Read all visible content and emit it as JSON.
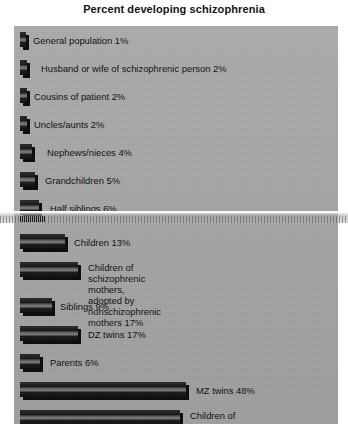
{
  "chart_data": {
    "type": "bar",
    "title": "Percent developing schizophrenia",
    "xlabel": "",
    "ylabel": "",
    "orientation": "horizontal",
    "grid": false,
    "legend": null,
    "xlim": [
      0,
      50
    ],
    "value_unit": "%",
    "categories": [
      "General population",
      "Husband or wife of schizophrenic person",
      "Cousins of patient",
      "Uncles/aunts",
      "Nephews/nieces",
      "Grandchildren",
      "Half siblings",
      "Children",
      "Children of schizophrenic mothers, adopted by nonschizophrenic mothers",
      "Siblings",
      "DZ twins",
      "Parents",
      "MZ twins",
      "Children of two schizophrenic parents"
    ],
    "values": [
      1,
      2,
      2,
      2,
      4,
      5,
      6,
      13,
      17,
      9,
      17,
      6,
      48,
      46
    ],
    "bars": [
      {
        "label": "General population 1%",
        "label_lines": [
          "General population 1%"
        ],
        "category": "General population",
        "value": 1,
        "top": 6,
        "bar_width": 6,
        "label_left": 13
      },
      {
        "label": "Husband or wife of schizophrenic person 2%",
        "label_lines": [
          "Husband or wife of schizophrenic person 2%"
        ],
        "category": "Husband or wife of schizophrenic person",
        "value": 2,
        "top": 34,
        "bar_width": 7,
        "label_left": 21
      },
      {
        "label": "Cousins of patient 2%",
        "label_lines": [
          "Cousins of patient 2%"
        ],
        "category": "Cousins of patient",
        "value": 2,
        "top": 62,
        "bar_width": 7,
        "label_left": 14
      },
      {
        "label": "Uncles/aunts 2%",
        "label_lines": [
          "Uncles/aunts 2%"
        ],
        "category": "Uncles/aunts",
        "value": 2,
        "top": 90,
        "bar_width": 7,
        "label_left": 14
      },
      {
        "label": "Nephews/nieces 4%",
        "label_lines": [
          "Nephews/nieces 4%"
        ],
        "category": "Nephews/nieces",
        "value": 4,
        "top": 118,
        "bar_width": 12,
        "label_left": 27
      },
      {
        "label": "Grandchildren 5%",
        "label_lines": [
          "Grandchildren 5%"
        ],
        "category": "Grandchildren",
        "value": 5,
        "top": 146,
        "bar_width": 15,
        "label_left": 25
      },
      {
        "label": "Half siblings 6%",
        "label_lines": [
          "Half siblings 6%"
        ],
        "category": "Half siblings",
        "value": 6,
        "top": 174,
        "bar_width": 19,
        "label_left": 30
      },
      {
        "label": "Children 13%",
        "label_lines": [
          "Children 13%"
        ],
        "category": "Children",
        "value": 13,
        "top": 208,
        "bar_width": 45,
        "label_left": 54
      },
      {
        "label": "Children of schizophrenic mothers,\nadopted by nonschizophrenic mothers 17%",
        "label_lines": [
          "Children of schizophrenic mothers,",
          "adopted by nonschizophrenic mothers 17%"
        ],
        "category": "Children of schizophrenic mothers, adopted by nonschizophrenic mothers",
        "value": 17,
        "top": 236,
        "bar_width": 58,
        "label_left": 68,
        "two_line": true
      },
      {
        "label": "Siblings 9%",
        "label_lines": [
          "Siblings 9%"
        ],
        "category": "Siblings",
        "value": 9,
        "top": 272,
        "bar_width": 32,
        "label_left": 40
      },
      {
        "label": "DZ twins 17%",
        "label_lines": [
          "DZ twins 17%"
        ],
        "category": "DZ twins",
        "value": 17,
        "top": 300,
        "bar_width": 58,
        "label_left": 68
      },
      {
        "label": "Parents 6%",
        "label_lines": [
          "Parents 6%"
        ],
        "category": "Parents",
        "value": 6,
        "top": 328,
        "bar_width": 20,
        "label_left": 30
      },
      {
        "label": "MZ twins 48%",
        "label_lines": [
          "MZ twins 48%"
        ],
        "category": "MZ twins",
        "value": 48,
        "top": 356,
        "bar_width": 166,
        "label_left": 176
      },
      {
        "label": "Children of two\nschizophrenic parents 46%",
        "label_lines": [
          "Children of two",
          "schizophrenic parents 46%"
        ],
        "category": "Children of two schizophrenic parents",
        "value": 46,
        "top": 384,
        "bar_width": 160,
        "label_left": 170,
        "two_line": true
      }
    ],
    "colors": {
      "panel_background": "#a8a8a8",
      "bar_fill": "#141414",
      "bar_highlight": "#7a7a7a",
      "bar_shadow": "#0a0a0a",
      "text": "#0f0f0f",
      "page_background": "#ffffff"
    },
    "artifacts": [
      {
        "name": "scan-glitch-band",
        "top": 211,
        "height": 12,
        "note": "horizontal scanner tear obscuring the 'Half siblings 6%' row"
      }
    ]
  }
}
